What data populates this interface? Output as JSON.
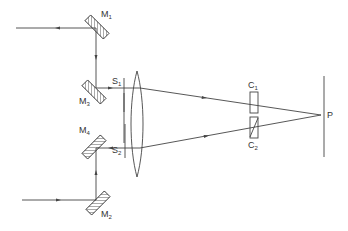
{
  "diagram": {
    "type": "optical-setup",
    "colors": {
      "line": "#444444",
      "background": "#ffffff"
    },
    "mirrors": [
      {
        "id": "M1",
        "label": "M",
        "subscript": "1"
      },
      {
        "id": "M2",
        "label": "M",
        "subscript": "2"
      },
      {
        "id": "M3",
        "label": "M",
        "subscript": "3"
      },
      {
        "id": "M4",
        "label": "M",
        "subscript": "4"
      }
    ],
    "slits": [
      {
        "id": "S1",
        "label": "S",
        "subscript": "1"
      },
      {
        "id": "S2",
        "label": "S",
        "subscript": "2"
      }
    ],
    "cells": [
      {
        "id": "C1",
        "label": "C",
        "subscript": "1"
      },
      {
        "id": "C2",
        "label": "C",
        "subscript": "2"
      }
    ],
    "point": {
      "id": "P",
      "label": "P"
    }
  }
}
